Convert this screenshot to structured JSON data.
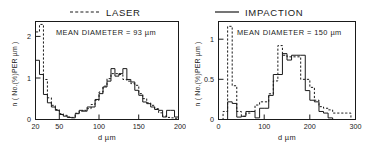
{
  "figure": {
    "panel_count": 2
  },
  "panels": [
    {
      "id": "laser",
      "title": "LASER",
      "legend_style": "dashed",
      "annotation": "MEAN DIAMETER  = 93 µm",
      "xlabel": "d  µm",
      "ylabel": "n ( No.(%)PER µm )",
      "xticks": [
        "20",
        "50",
        "100",
        "150",
        "200"
      ],
      "yticks": [
        "0",
        "1",
        "2"
      ],
      "chart_data": {
        "type": "line",
        "subtype": "step-histogram",
        "title": "LASER",
        "xlabel": "d  µm",
        "ylabel": "n ( No.(%)PER µm )",
        "xlim": [
          20,
          200
        ],
        "ylim": [
          0,
          2.35
        ],
        "xticks": [
          20,
          50,
          100,
          150,
          200
        ],
        "yticks": [
          0,
          1,
          2
        ],
        "grid": false,
        "legend_position": "above-plot",
        "annotations": [
          {
            "text": "MEAN DIAMETER  = 93 µm",
            "x": 60,
            "y": 2.05
          }
        ],
        "bin_width": 5,
        "bin_edges": [
          20,
          25,
          30,
          35,
          40,
          45,
          50,
          55,
          60,
          65,
          70,
          75,
          80,
          85,
          90,
          95,
          100,
          105,
          110,
          115,
          120,
          125,
          130,
          135,
          140,
          145,
          150,
          155,
          160,
          165,
          170,
          175,
          180,
          185,
          190,
          195,
          200
        ],
        "series": [
          {
            "name": "IMPACTION",
            "style": "solid",
            "values": [
              1.42,
              1.08,
              0.6,
              0.4,
              0.3,
              0.22,
              0.12,
              0.08,
              0.05,
              0.04,
              0.14,
              0.22,
              0.2,
              0.3,
              0.3,
              0.48,
              0.62,
              0.78,
              0.92,
              1.22,
              1.04,
              1.1,
              1.22,
              0.96,
              0.9,
              0.7,
              0.58,
              0.42,
              0.38,
              0.3,
              0.24,
              0.22,
              0.06,
              0.22,
              0.22,
              0.06
            ]
          },
          {
            "name": "LASER",
            "style": "dashed",
            "values": [
              2.1,
              2.28,
              0.96,
              0.52,
              0.34,
              0.24,
              0.14,
              0.1,
              0.06,
              0.05,
              0.15,
              0.2,
              0.22,
              0.26,
              0.36,
              0.46,
              0.66,
              0.8,
              0.98,
              1.1,
              1.1,
              1.08,
              0.96,
              0.92,
              0.86,
              0.82,
              0.62,
              0.5,
              0.4,
              0.34,
              0.26,
              0.16,
              0.08,
              0.05,
              0.04,
              0.03
            ]
          }
        ]
      }
    },
    {
      "id": "impaction",
      "title": "IMPACTION",
      "legend_style": "solid",
      "annotation": "MEAN DIAMETER  = 150 µm",
      "xlabel": "d  µm",
      "ylabel": "n ( No.(%)PER µm )",
      "xticks": [
        "0",
        "100",
        "200",
        "300"
      ],
      "yticks": [
        "0",
        "0.5",
        "1"
      ],
      "chart_data": {
        "type": "line",
        "subtype": "step-histogram",
        "title": "IMPACTION",
        "xlabel": "d  µm",
        "ylabel": "n ( No.(%)PER µm )",
        "xlim": [
          0,
          300
        ],
        "ylim": [
          0,
          1.22
        ],
        "xticks": [
          0,
          100,
          200,
          300
        ],
        "yticks": [
          0,
          0.5,
          1
        ],
        "grid": false,
        "legend_position": "above-plot",
        "annotations": [
          {
            "text": "MEAN DIAMETER  = 150 µm",
            "x": 70,
            "y": 1.02
          }
        ],
        "bin_width": 10,
        "bin_edges": [
          0,
          10,
          20,
          30,
          40,
          50,
          60,
          70,
          80,
          90,
          100,
          110,
          120,
          130,
          140,
          150,
          160,
          170,
          180,
          190,
          200,
          210,
          220,
          230,
          240,
          250,
          260,
          270,
          280,
          290,
          300
        ],
        "series": [
          {
            "name": "IMPACTION",
            "style": "solid",
            "values": [
              0.0,
              0.0,
              0.22,
              0.2,
              0.03,
              0.04,
              0.1,
              0.1,
              0.02,
              0.14,
              0.14,
              0.3,
              0.56,
              0.56,
              0.82,
              0.74,
              0.8,
              0.8,
              0.8,
              0.36,
              0.24,
              0.22,
              0.1,
              0.08,
              0.02,
              0.0,
              0.0,
              0.0,
              0.0,
              0.0
            ]
          },
          {
            "name": "LASER",
            "style": "dashed",
            "values": [
              0.0,
              0.1,
              1.16,
              0.42,
              0.1,
              0.04,
              0.08,
              0.1,
              0.18,
              0.22,
              0.22,
              0.32,
              0.48,
              0.92,
              0.8,
              0.78,
              0.78,
              0.78,
              0.5,
              0.5,
              0.4,
              0.24,
              0.16,
              0.14,
              0.12,
              0.08,
              0.08,
              0.08,
              0.08,
              0.0
            ]
          }
        ]
      }
    }
  ]
}
